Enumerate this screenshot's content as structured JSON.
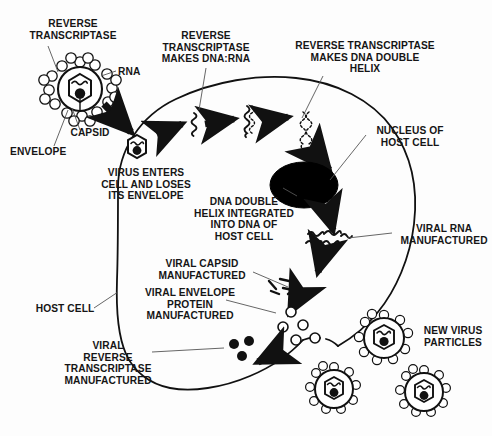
{
  "diagram": {
    "colors": {
      "background": "#fdfdfd",
      "ink": "#111111",
      "nucleus_fill": "#000000",
      "membrane_stroke": "#111111"
    },
    "labels": [
      {
        "id": "reverse-transcriptase",
        "text": "REVERSE\nTRANSCRIPTASE",
        "x": 18,
        "y": 18,
        "w": 110,
        "align": "center"
      },
      {
        "id": "rna",
        "text": "RNA",
        "x": 118,
        "y": 66,
        "w": 34,
        "align": "left"
      },
      {
        "id": "capsid",
        "text": "CAPSID",
        "x": 60,
        "y": 127,
        "w": 60,
        "align": "center"
      },
      {
        "id": "envelope",
        "text": "ENVELOPE",
        "x": 10,
        "y": 146,
        "w": 76,
        "align": "left"
      },
      {
        "id": "rt-makes-dna-rna",
        "text": "REVERSE\nTRANSCRIPTASE\nMAKES DNA:RNA",
        "x": 150,
        "y": 30,
        "w": 112,
        "align": "center"
      },
      {
        "id": "rt-makes-dna-double-helix",
        "text": "REVERSE TRANSCRIPTASE\nMAKES DNA DOUBLE\nHELIX",
        "x": 290,
        "y": 40,
        "w": 150,
        "align": "center"
      },
      {
        "id": "virus-enters-cell",
        "text": "VIRUS ENTERS\nCELL AND LOSES\nITS ENVELOPE",
        "x": 92,
        "y": 167,
        "w": 108,
        "align": "center"
      },
      {
        "id": "nucleus-of-host-cell",
        "text": "NUCLEUS OF\nHOST CELL",
        "x": 366,
        "y": 125,
        "w": 88,
        "align": "center"
      },
      {
        "id": "dna-integrated",
        "text": "DNA DOUBLE\nHELIX INTEGRATED\nINTO DNA OF\nHOST CELL",
        "x": 186,
        "y": 196,
        "w": 116,
        "align": "center"
      },
      {
        "id": "viral-rna-manufactured",
        "text": "VIRAL RNA\nMANUFACTURED",
        "x": 396,
        "y": 223,
        "w": 96,
        "align": "center"
      },
      {
        "id": "viral-capsid-manufactured",
        "text": "VIRAL CAPSID\nMANUFACTURED",
        "x": 146,
        "y": 258,
        "w": 112,
        "align": "center"
      },
      {
        "id": "viral-envelope-protein",
        "text": "VIRAL ENVELOPE\nPROTEIN\nMANUFACTURED",
        "x": 134,
        "y": 287,
        "w": 112,
        "align": "center"
      },
      {
        "id": "host-cell",
        "text": "HOST CELL",
        "x": 32,
        "y": 303,
        "w": 66,
        "align": "center"
      },
      {
        "id": "viral-rt-manufactured",
        "text": "VIRAL\nREVERSE\nTRANSCRIPTASE\nMANUFACTURED",
        "x": 54,
        "y": 340,
        "w": 108,
        "align": "center"
      },
      {
        "id": "new-virus-particles",
        "text": "NEW VIRUS\nPARTICLES",
        "x": 414,
        "y": 325,
        "w": 78,
        "align": "center"
      }
    ],
    "structures": {
      "free_virion": {
        "id": "free-virion",
        "cx": 80,
        "cy": 89,
        "r": 22
      },
      "entered_virion": {
        "id": "entered-capsid",
        "cx": 137,
        "cy": 147,
        "r": 12
      },
      "nucleus": {
        "id": "nucleus",
        "cx": 304,
        "cy": 185,
        "rx": 34,
        "ry": 23
      },
      "new_virions": [
        {
          "id": "new-virion-1",
          "cx": 384,
          "cy": 338,
          "r": 20
        },
        {
          "id": "new-virion-2",
          "cx": 334,
          "cy": 389,
          "r": 19
        },
        {
          "id": "new-virion-3",
          "cx": 424,
          "cy": 392,
          "r": 19
        }
      ],
      "envelope_protein_circles": [
        {
          "cx": 291,
          "cy": 312,
          "r": 5
        },
        {
          "cx": 283,
          "cy": 327,
          "r": 5
        },
        {
          "cx": 303,
          "cy": 325,
          "r": 5
        },
        {
          "cx": 296,
          "cy": 340,
          "r": 5
        },
        {
          "cx": 315,
          "cy": 338,
          "r": 5
        }
      ],
      "reverse_transcriptase_dots": [
        {
          "cx": 234,
          "cy": 344,
          "r": 5
        },
        {
          "cx": 249,
          "cy": 341,
          "r": 5
        },
        {
          "cx": 242,
          "cy": 356,
          "r": 5
        }
      ]
    },
    "steps": [
      "Virion with envelope, capsid, RNA and reverse transcriptase binds the host cell",
      "Virus enters cell and loses its envelope",
      "Reverse transcriptase makes DNA:RNA hybrid",
      "Reverse transcriptase makes DNA double helix",
      "DNA double helix integrated into DNA of host cell nucleus",
      "Viral RNA manufactured",
      "Viral capsid manufactured",
      "Viral envelope protein manufactured",
      "Viral reverse transcriptase manufactured",
      "New virus particles bud from the host cell"
    ]
  }
}
